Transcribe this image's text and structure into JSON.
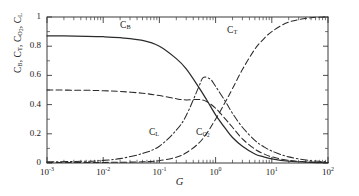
{
  "chart_data": {
    "type": "line",
    "title": "",
    "xlabel": "G",
    "ylabel": "C_B, C_T, C_O2, C_L",
    "xscale": "log",
    "xlim": [
      0.001,
      100
    ],
    "ylim": [
      0,
      1
    ],
    "xticks": [
      "10^-3",
      "10^-2",
      "10^-1",
      "10^0",
      "10^1",
      "10^2"
    ],
    "xtick_labels": [
      "10",
      "10",
      "10",
      "10",
      "10",
      "10"
    ],
    "xtick_exponents": [
      "-3",
      "-2",
      "-1",
      "0",
      "1",
      "2"
    ],
    "yticks": [
      0,
      0.2,
      0.4,
      0.6,
      0.8,
      1
    ],
    "ytick_labels": [
      "0",
      "0.2",
      "0.4",
      "0.6",
      "0.8",
      "1"
    ],
    "grid": false,
    "legend": "inline-annotations",
    "series": [
      {
        "name": "C_B",
        "label_base": "C",
        "label_sub": "B",
        "style": "solid",
        "color": "#2b2b2b",
        "annotation_x": 0.02,
        "annotation_y": 0.93,
        "x": [
          0.001,
          0.002,
          0.005,
          0.01,
          0.02,
          0.05,
          0.1,
          0.2,
          0.3,
          0.5,
          0.7,
          1.0,
          1.5,
          2.0,
          3.0,
          5.0,
          7.0,
          10.0,
          20.0,
          50.0,
          100.0
        ],
        "values": [
          0.87,
          0.87,
          0.868,
          0.865,
          0.858,
          0.84,
          0.8,
          0.715,
          0.645,
          0.52,
          0.43,
          0.33,
          0.235,
          0.175,
          0.115,
          0.062,
          0.043,
          0.028,
          0.012,
          0.004,
          0.002
        ]
      },
      {
        "name": "C_T",
        "label_base": "C",
        "label_sub": "T",
        "style": "dashed",
        "color": "#2b2b2b",
        "annotation_x": 1.6,
        "annotation_y": 0.9,
        "x": [
          0.001,
          0.01,
          0.05,
          0.1,
          0.2,
          0.3,
          0.5,
          0.7,
          1.0,
          1.5,
          2.0,
          3.0,
          5.0,
          7.0,
          10.0,
          20.0,
          50.0,
          100.0
        ],
        "values": [
          0.003,
          0.004,
          0.008,
          0.016,
          0.04,
          0.07,
          0.135,
          0.205,
          0.3,
          0.42,
          0.51,
          0.64,
          0.78,
          0.845,
          0.9,
          0.965,
          0.995,
          1.0
        ]
      },
      {
        "name": "C_O2",
        "label_base": "C",
        "label_sub": "O2",
        "style": "dashed",
        "color": "#2b2b2b",
        "annotation_x": 0.45,
        "annotation_y": 0.2,
        "x": [
          0.001,
          0.005,
          0.01,
          0.02,
          0.05,
          0.1,
          0.2,
          0.3,
          0.5,
          0.7,
          1.0,
          1.5,
          2.0,
          3.0,
          5.0,
          7.0,
          10.0,
          20.0,
          50.0,
          100.0
        ],
        "values": [
          0.5,
          0.498,
          0.495,
          0.49,
          0.478,
          0.462,
          0.44,
          0.432,
          0.435,
          0.42,
          0.375,
          0.3,
          0.245,
          0.165,
          0.095,
          0.065,
          0.042,
          0.018,
          0.006,
          0.003
        ]
      },
      {
        "name": "C_L",
        "label_base": "C",
        "label_sub": "L",
        "style": "dashdot",
        "color": "#2b2b2b",
        "annotation_x": 0.065,
        "annotation_y": 0.2,
        "x": [
          0.001,
          0.005,
          0.01,
          0.02,
          0.05,
          0.1,
          0.2,
          0.3,
          0.5,
          0.6,
          0.8,
          1.0,
          1.5,
          2.0,
          3.0,
          5.0,
          7.0,
          10.0,
          20.0,
          50.0,
          100.0
        ],
        "values": [
          0.008,
          0.012,
          0.018,
          0.03,
          0.065,
          0.115,
          0.225,
          0.325,
          0.52,
          0.585,
          0.575,
          0.525,
          0.42,
          0.34,
          0.245,
          0.155,
          0.115,
          0.082,
          0.042,
          0.016,
          0.008
        ]
      }
    ]
  },
  "axes": {
    "x_label_text": "G",
    "y_label_prefix": "C",
    "y_label_parts": [
      "B",
      "T",
      "O",
      "L"
    ]
  }
}
